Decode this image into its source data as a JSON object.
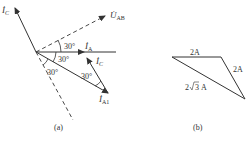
{
  "figure_a": {
    "caption": "(a)",
    "vectors": {
      "ic_long": {
        "label": "İ",
        "sub": "C"
      },
      "uab": {
        "label": "U̇",
        "sub": "AB"
      },
      "ia": {
        "label": "İ",
        "sub": "A"
      },
      "ia1": {
        "label": "İ",
        "sub": "A1"
      },
      "ic_short": {
        "label": "İ",
        "sub": "C"
      }
    },
    "angles": {
      "uab_ia": "30°",
      "ia_ia1": "30°",
      "ia1_dashed": "30°",
      "ia1_ic": "30°"
    }
  },
  "figure_b": {
    "caption": "(b)",
    "sides": {
      "top": "2A",
      "right": "2A",
      "hyp_prefix": "2",
      "hyp_root": "3",
      "hyp_unit": "A"
    }
  },
  "colors": {
    "line": "#333333",
    "background": "#ffffff"
  }
}
